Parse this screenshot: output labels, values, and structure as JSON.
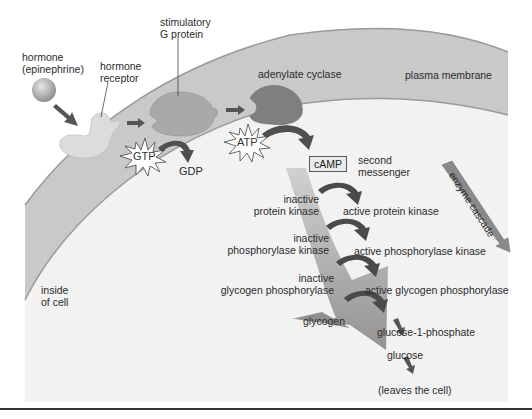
{
  "figure": {
    "colors": {
      "background": "#ffffff",
      "cell_interior": "#f2f2f2",
      "membrane": "#c9c9c9",
      "membrane_edge": "#9a9a9a",
      "receptor": "#dcdcdc",
      "g_protein": "#a9a9a9",
      "adenylate_cyclase": "#7f7f7f",
      "arrow_dark": "#555555",
      "cascade_band": "#b3b3b3",
      "camp_box": "#eaeaea",
      "divider": "#333333"
    }
  },
  "labels": {
    "hormone": "hormone",
    "hormone_sub": "(epinephrine)",
    "receptor_line1": "hormone",
    "receptor_line2": "receptor",
    "gprotein_line1": "stimulatory",
    "gprotein_line2": "G protein",
    "adenylate_cyclase": "adenylate cyclase",
    "plasma_membrane": "plasma membrane",
    "gtp": "GTP",
    "gdp": "GDP",
    "atp": "ATP",
    "camp": "cAMP",
    "second_messenger_line1": "second",
    "second_messenger_line2": "messenger",
    "enzyme_cascade": "enzyme cascade",
    "inside_cell_line1": "inside",
    "inside_cell_line2": "of cell"
  },
  "cascade_steps": [
    {
      "inactive_line1": "inactive",
      "inactive_line2": "protein kinase",
      "active": "active protein kinase"
    },
    {
      "inactive_line1": "inactive",
      "inactive_line2": "phosphorylase kinase",
      "active": "active phosphorylase kinase"
    },
    {
      "inactive_line1": "inactive",
      "inactive_line2": "glycogen phosphorylase",
      "active": "active glycogen phosphorylase"
    }
  ],
  "products": {
    "glycogen": "glycogen",
    "glucose_1_phosphate": "glucose-1-phosphate",
    "glucose": "glucose",
    "leaves": "(leaves the cell)"
  }
}
